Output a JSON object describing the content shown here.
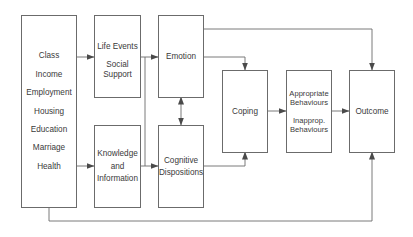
{
  "diagram": {
    "line_color": "#6b6b6b",
    "nodes": {
      "socio_demographics": {
        "lines": [
          "Class",
          "Income",
          "Employment",
          "Housing",
          "Education",
          "Marriage",
          "Health"
        ]
      },
      "life_events": {
        "lines": [
          "Life Events",
          "Social",
          "Support"
        ]
      },
      "knowledge": {
        "lines": [
          "Knowledge",
          "and",
          "Information"
        ]
      },
      "emotion": {
        "lines": [
          "Emotion"
        ]
      },
      "cognitive": {
        "lines": [
          "Cognitive",
          "Dispositions"
        ]
      },
      "coping": {
        "lines": [
          "Coping"
        ]
      },
      "behaviours": {
        "lines": [
          "Appropriate",
          "Behaviours",
          "Inapprop.",
          "Behaviours"
        ]
      },
      "outcome": {
        "lines": [
          "Outcome"
        ]
      }
    },
    "edges": [
      {
        "from": "socio_demographics",
        "to": "life_events"
      },
      {
        "from": "socio_demographics",
        "to": "knowledge"
      },
      {
        "from": "life_events",
        "to": "emotion"
      },
      {
        "from": "life_events",
        "to": "cognitive"
      },
      {
        "from": "knowledge",
        "to": "emotion"
      },
      {
        "from": "knowledge",
        "to": "cognitive"
      },
      {
        "from": "emotion",
        "to": "cognitive",
        "bidirectional": true
      },
      {
        "from": "emotion",
        "to": "coping"
      },
      {
        "from": "cognitive",
        "to": "coping"
      },
      {
        "from": "coping",
        "to": "behaviours"
      },
      {
        "from": "behaviours",
        "to": "outcome"
      },
      {
        "from": "emotion",
        "to": "outcome"
      },
      {
        "from": "socio_demographics",
        "to": "outcome"
      }
    ]
  }
}
